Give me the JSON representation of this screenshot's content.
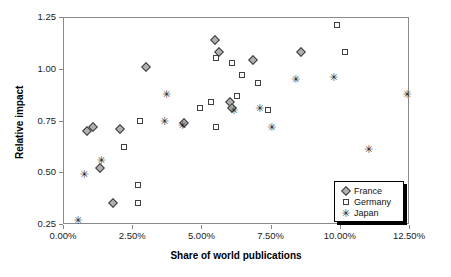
{
  "chart_data": {
    "type": "scatter",
    "title": "",
    "xlabel": "Share of world publications",
    "ylabel": "Relative impact",
    "xlim": [
      0.0,
      12.5
    ],
    "ylim": [
      0.25,
      1.25
    ],
    "grid": false,
    "xticks": [
      "0.00%",
      "2.50%",
      "5.00%",
      "7.50%",
      "10.00%",
      "12.50%"
    ],
    "xtick_values": [
      0.0,
      2.5,
      5.0,
      7.5,
      10.0,
      12.5
    ],
    "yticks": [
      "0.25",
      "0.50",
      "0.75",
      "1.00",
      "1.25"
    ],
    "ytick_values": [
      0.25,
      0.5,
      0.75,
      1.0,
      1.25
    ],
    "legend_position": "bottom-right",
    "series": [
      {
        "name": "France",
        "marker": "diamond",
        "color": "#b0b0b0",
        "edge_color": "#3a3a3a",
        "points": [
          {
            "x": 0.86,
            "y": 0.7
          },
          {
            "x": 1.1,
            "y": 0.72
          },
          {
            "x": 2.06,
            "y": 0.71
          },
          {
            "x": 1.34,
            "y": 0.52
          },
          {
            "x": 1.81,
            "y": 0.35
          },
          {
            "x": 3.01,
            "y": 1.01
          },
          {
            "x": 4.38,
            "y": 0.74
          },
          {
            "x": 5.48,
            "y": 1.14
          },
          {
            "x": 6.02,
            "y": 0.84
          },
          {
            "x": 5.65,
            "y": 1.08
          },
          {
            "x": 6.09,
            "y": 0.81
          },
          {
            "x": 6.85,
            "y": 1.04
          },
          {
            "x": 8.59,
            "y": 1.08
          }
        ]
      },
      {
        "name": "Germany",
        "marker": "square",
        "color": "#ffffff",
        "edge_color": "#404040",
        "points": [
          {
            "x": 2.21,
            "y": 0.62
          },
          {
            "x": 2.72,
            "y": 0.44
          },
          {
            "x": 2.72,
            "y": 0.35
          },
          {
            "x": 2.79,
            "y": 0.75
          },
          {
            "x": 4.96,
            "y": 0.81
          },
          {
            "x": 5.51,
            "y": 0.72
          },
          {
            "x": 5.51,
            "y": 1.05
          },
          {
            "x": 5.36,
            "y": 0.84
          },
          {
            "x": 6.3,
            "y": 0.87
          },
          {
            "x": 6.09,
            "y": 1.03
          },
          {
            "x": 6.48,
            "y": 0.97
          },
          {
            "x": 7.03,
            "y": 0.93
          },
          {
            "x": 7.39,
            "y": 0.8
          },
          {
            "x": 9.9,
            "y": 1.21
          },
          {
            "x": 10.18,
            "y": 1.08
          }
        ]
      },
      {
        "name": "Japan",
        "marker": "star",
        "color": "#2b2b2b",
        "edge_color": "#2b2b2b",
        "points": [
          {
            "x": 0.54,
            "y": 0.27
          },
          {
            "x": 0.76,
            "y": 0.49
          },
          {
            "x": 1.38,
            "y": 0.56
          },
          {
            "x": 3.73,
            "y": 0.88
          },
          {
            "x": 3.66,
            "y": 0.75
          },
          {
            "x": 4.31,
            "y": 0.73
          },
          {
            "x": 6.16,
            "y": 0.8
          },
          {
            "x": 7.1,
            "y": 0.81
          },
          {
            "x": 7.54,
            "y": 0.72
          },
          {
            "x": 8.4,
            "y": 0.95
          },
          {
            "x": 9.78,
            "y": 0.96
          },
          {
            "x": 11.04,
            "y": 0.61
          },
          {
            "x": 12.42,
            "y": 0.88
          }
        ]
      }
    ]
  },
  "legend": {
    "items": [
      {
        "label": "France",
        "marker": "diamond"
      },
      {
        "label": "Germany",
        "marker": "square"
      },
      {
        "label": "Japan",
        "marker": "star"
      }
    ]
  },
  "symbols": {
    "star_glyph": "✳"
  }
}
